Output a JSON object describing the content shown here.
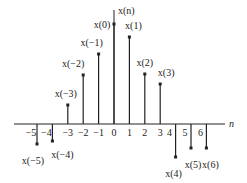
{
  "chart_data": {
    "type": "stem",
    "title": "",
    "ylabel": "x(n)",
    "xlabel": "n",
    "x": [
      -5,
      -4,
      -3,
      -2,
      -1,
      0,
      1,
      2,
      3,
      4,
      5,
      6
    ],
    "values": [
      -20,
      -17,
      19,
      49,
      70,
      100,
      87,
      50,
      40,
      -33,
      -24,
      -24
    ],
    "labels": [
      "x(−5)",
      "x(−4)",
      "x(−3)",
      "x(−2)",
      "x(−1)",
      "x(0)",
      "x(1)",
      "x(2)",
      "x(3)",
      "x(4)",
      "x(5)",
      "x(6)"
    ],
    "tick_labels": [
      "−5",
      "−4",
      "−3",
      "−2",
      "−1",
      "0",
      "1",
      "2",
      "3",
      "4",
      "5",
      "6"
    ],
    "grid": false
  },
  "axes": {
    "y_label": "x(n)",
    "x_label": "n"
  },
  "colors": {
    "stroke": "#222222",
    "background": "#ffffff"
  }
}
